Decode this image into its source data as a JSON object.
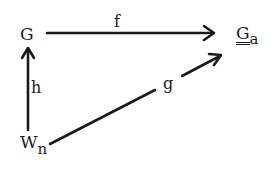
{
  "diagram": {
    "type": "commutative-diagram",
    "nodes": {
      "g_top_left": {
        "label": "G"
      },
      "g_a": {
        "label": "G",
        "subscript": "a",
        "decoration": "double-underline"
      },
      "w_n": {
        "label": "W",
        "subscript": "n"
      }
    },
    "arrows": {
      "f": {
        "label": "f",
        "from": "G",
        "to": "G_a"
      },
      "h": {
        "label": "h",
        "from": "W_n",
        "to": "G"
      },
      "g": {
        "label": "g",
        "from": "W_n",
        "to": "G_a"
      }
    },
    "colors": {
      "ink": "#1a1a1a",
      "background": "#ffffff"
    }
  }
}
